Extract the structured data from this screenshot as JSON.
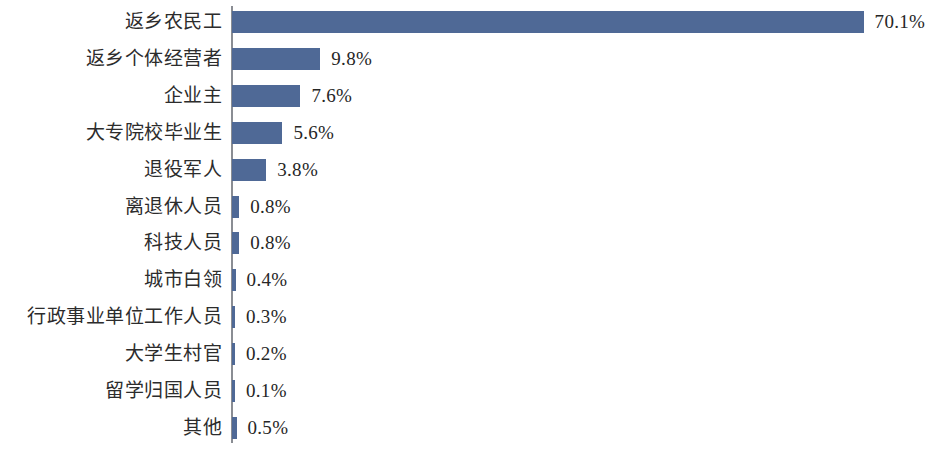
{
  "chart_data": {
    "type": "bar",
    "orientation": "horizontal",
    "title": "",
    "subtitle": "",
    "xlabel": "",
    "ylabel": "",
    "xlim": [
      0,
      70.1
    ],
    "grid": false,
    "legend": false,
    "legend_position": "none",
    "value_suffix": "%",
    "categories": [
      "返乡农民工",
      "返乡个体经营者",
      "企业主",
      "大专院校毕业生",
      "退役军人",
      "离退休人员",
      "科技人员",
      "城市白领",
      "行政事业单位工作人员",
      "大学生村官",
      "留学归国人员",
      "其他"
    ],
    "values": [
      70.1,
      9.8,
      7.6,
      5.6,
      3.8,
      0.8,
      0.8,
      0.4,
      0.3,
      0.2,
      0.1,
      0.5
    ],
    "value_labels": [
      "70.1%",
      "9.8%",
      "7.6%",
      "5.6%",
      "3.8%",
      "0.8%",
      "0.8%",
      "0.4%",
      "0.3%",
      "0.2%",
      "0.1%",
      "0.5%"
    ],
    "colors": {
      "bar": "#4f6996",
      "axis": "#8a8d93",
      "text": "#2c2c2c",
      "background": "#ffffff"
    }
  }
}
